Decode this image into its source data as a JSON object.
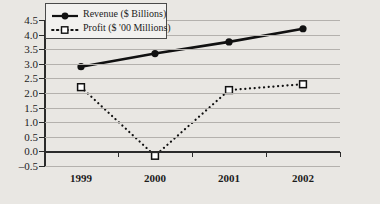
{
  "chart_data": {
    "type": "line",
    "title": "",
    "xlabel": "",
    "ylabel": "",
    "categories": [
      "1999",
      "2000",
      "2001",
      "2002"
    ],
    "ylim": [
      -0.5,
      4.5
    ],
    "ytick_step": 0.5,
    "yticks": [
      "4.5",
      "4.0",
      "3.5",
      "3.0",
      "2.5",
      "2.0",
      "1.5",
      "1.0",
      "0.5",
      "0.0",
      "–0.5"
    ],
    "ytick_values": [
      4.5,
      4.0,
      3.5,
      3.0,
      2.5,
      2.0,
      1.5,
      1.0,
      0.5,
      0.0,
      -0.5
    ],
    "grid": true,
    "legend_position": "top-left",
    "series": [
      {
        "name": "Revenue ($ Billions)",
        "marker": "filled-circle",
        "line_style": "solid",
        "color": "#111111",
        "values": [
          2.9,
          3.35,
          3.75,
          4.2
        ]
      },
      {
        "name": "Profit ($ '00 Millions)",
        "marker": "open-square",
        "line_style": "dotted",
        "color": "#111111",
        "values": [
          2.2,
          -0.15,
          2.1,
          2.3
        ]
      }
    ]
  },
  "legend": {
    "items": [
      {
        "label": "Revenue ($ Billions)"
      },
      {
        "label": "Profit ($ '00 Millions)"
      }
    ]
  },
  "colors": {
    "background": "#e9e7e3",
    "gridline": "#b4b1ad",
    "axis": "#2b2b2b",
    "series": "#111111",
    "legend_background": "#f2f1ef",
    "legend_border": "#4a4a4a"
  }
}
